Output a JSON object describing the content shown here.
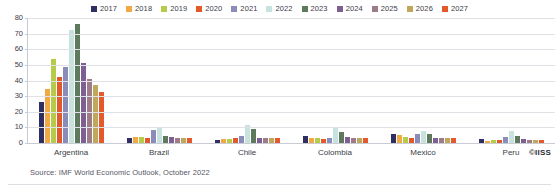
{
  "chart_data": {
    "type": "bar",
    "title": "",
    "xlabel": "",
    "ylabel": "",
    "ylim": [
      0,
      80
    ],
    "yticks": [
      0,
      10,
      20,
      30,
      40,
      50,
      60,
      70,
      80
    ],
    "grid": true,
    "legend_position": "top-center",
    "categories": [
      "Argentina",
      "Brazil",
      "Chile",
      "Colombia",
      "Mexico",
      "Peru"
    ],
    "series": [
      {
        "name": "2017",
        "color": "#2f2f63",
        "values": [
          26.0,
          3.4,
          2.2,
          4.3,
          6.0,
          2.8
        ]
      },
      {
        "name": "2018",
        "color": "#f0a945",
        "values": [
          34.3,
          3.7,
          2.4,
          3.2,
          4.9,
          1.3
        ]
      },
      {
        "name": "2019",
        "color": "#b6cb49",
        "values": [
          53.5,
          3.7,
          2.3,
          3.5,
          3.6,
          2.1
        ]
      },
      {
        "name": "2020",
        "color": "#e4592a",
        "values": [
          42.0,
          3.2,
          3.0,
          2.5,
          3.4,
          1.8
        ]
      },
      {
        "name": "2021",
        "color": "#8b8cba",
        "values": [
          48.4,
          8.3,
          4.5,
          3.5,
          5.7,
          4.0
        ]
      },
      {
        "name": "2022",
        "color": "#c6e3e0",
        "values": [
          72.4,
          9.4,
          11.6,
          10.0,
          8.0,
          7.5
        ]
      },
      {
        "name": "2023",
        "color": "#5d7a5c",
        "values": [
          76.1,
          4.7,
          8.7,
          7.1,
          6.0,
          4.4
        ]
      },
      {
        "name": "2024",
        "color": "#7d5f93",
        "values": [
          51.1,
          3.6,
          3.5,
          3.9,
          3.5,
          2.6
        ]
      },
      {
        "name": "2025",
        "color": "#9d7b88",
        "values": [
          41.0,
          3.2,
          3.0,
          3.2,
          3.1,
          2.0
        ]
      },
      {
        "name": "2026",
        "color": "#bfa85c",
        "values": [
          37.0,
          3.1,
          3.0,
          3.0,
          3.0,
          2.0
        ]
      },
      {
        "name": "2027",
        "color": "#e4592a",
        "values": [
          32.5,
          3.0,
          3.0,
          3.0,
          3.0,
          2.0
        ]
      }
    ]
  },
  "footer": {
    "source": "Source: IMF World Economic Outlook, October 2022",
    "copyright": "©IISS"
  }
}
